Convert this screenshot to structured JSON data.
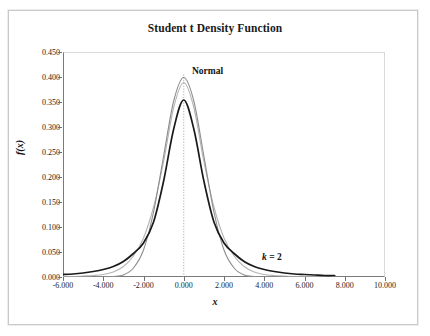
{
  "figure": {
    "title": "Student t Density Function",
    "frame_color": "#c9c9c9",
    "background": "#ffffff"
  },
  "axes": {
    "xlabel": "x",
    "ylabel": "f(x)",
    "x_ticks": [
      "-6.000",
      "-4.000",
      "-2.000",
      "0.000",
      "2.000",
      "4.000",
      "6.000",
      "8.000",
      "10.000"
    ],
    "y_ticks": [
      "0.000",
      "0.050",
      "0.100",
      "0.150",
      "0.200",
      "0.250",
      "0.300",
      "0.350",
      "0.400",
      "0.450"
    ]
  },
  "annotations": {
    "normal": "Normal",
    "k_symbol": "k",
    "k_value": " = 2"
  },
  "chart_data": {
    "type": "line",
    "title": "Student t Density Function",
    "xlabel": "x",
    "ylabel": "f(x)",
    "xlim": [
      -6.0,
      10.0
    ],
    "ylim": [
      0.0,
      0.45
    ],
    "xtick_values": [
      -6.0,
      -4.0,
      -2.0,
      0.0,
      2.0,
      4.0,
      6.0,
      8.0,
      10.0
    ],
    "ytick_values": [
      0.0,
      0.05,
      0.1,
      0.15,
      0.2,
      0.25,
      0.3,
      0.35,
      0.4,
      0.45
    ],
    "grid": false,
    "legend": "annotated-inline",
    "reference_line": {
      "type": "vertical",
      "x": 0.0,
      "style": "dotted",
      "color": "#9a9a9a"
    },
    "x": [
      -6.0,
      -5.5,
      -5.0,
      -4.5,
      -4.0,
      -3.5,
      -3.0,
      -2.5,
      -2.0,
      -1.5,
      -1.0,
      -0.5,
      0.0,
      0.5,
      1.0,
      1.5,
      2.0,
      2.5,
      3.0,
      3.5,
      4.0,
      4.5,
      5.0,
      5.5,
      6.0,
      6.5,
      7.0,
      7.5
    ],
    "series": [
      {
        "name": "Normal",
        "color": "#8d8d8d",
        "peak": 0.399,
        "values": [
          0.0,
          0.0,
          0.0,
          0.0,
          0.0,
          0.001,
          0.004,
          0.018,
          0.054,
          0.13,
          0.242,
          0.352,
          0.399,
          0.352,
          0.242,
          0.13,
          0.054,
          0.018,
          0.004,
          0.001,
          0.0,
          0.0,
          0.0,
          0.0,
          0.0,
          0.0,
          0.0,
          0.0
        ]
      },
      {
        "name": "k = 10",
        "color": "#b4b4b4",
        "peak": 0.389,
        "values": [
          0.001,
          0.001,
          0.002,
          0.003,
          0.005,
          0.01,
          0.021,
          0.042,
          0.078,
          0.14,
          0.231,
          0.339,
          0.389,
          0.339,
          0.231,
          0.14,
          0.078,
          0.042,
          0.021,
          0.01,
          0.005,
          0.003,
          0.002,
          0.001,
          0.001,
          0.001,
          0.0,
          0.0
        ]
      },
      {
        "name": "k = 2",
        "color": "#1a1a1a",
        "peak": 0.354,
        "values": [
          0.005,
          0.006,
          0.008,
          0.011,
          0.015,
          0.021,
          0.031,
          0.047,
          0.068,
          0.11,
          0.192,
          0.296,
          0.354,
          0.296,
          0.192,
          0.11,
          0.068,
          0.047,
          0.031,
          0.021,
          0.015,
          0.011,
          0.008,
          0.006,
          0.005,
          0.004,
          0.003,
          0.003
        ]
      }
    ]
  }
}
